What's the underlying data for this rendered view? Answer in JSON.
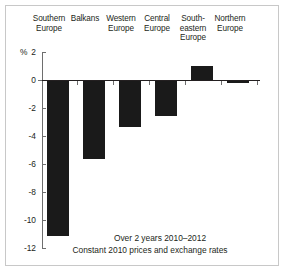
{
  "chart_data": {
    "type": "bar",
    "title": "",
    "subtitle": "",
    "xlabel": "",
    "ylabel": "%",
    "unit_label": "%",
    "categories": [
      "Southern Europe",
      "Balkans",
      "Western Europe",
      "Central Europe",
      "South-eastern Europe",
      "Northern Europe"
    ],
    "category_lines": [
      [
        "Southern",
        "Europe"
      ],
      [
        "Balkans"
      ],
      [
        "Western",
        "Europe"
      ],
      [
        "Central",
        "Europe"
      ],
      [
        "South-",
        "eastern",
        "Europe"
      ],
      [
        "Northern",
        "Europe"
      ]
    ],
    "values": [
      -11.1,
      -5.6,
      -3.3,
      -2.5,
      1.0,
      -0.1
    ],
    "ylim": [
      -12,
      2
    ],
    "yticks": [
      2,
      0,
      -2,
      -4,
      -6,
      -8,
      -10,
      -12
    ],
    "ytick_labels": [
      "2",
      "0",
      "-2",
      "-4",
      "-6",
      "-8",
      "-10",
      "-12"
    ],
    "grid": false,
    "legend": false,
    "bar_color": "#1a1a1a",
    "axis_color": "#6e6e6e",
    "annotations": [
      "Over 2 years 2010–2012",
      "Constant 2010 prices and exchange rates"
    ]
  },
  "caption": {
    "line1": "Over 2 years 2010–2012",
    "line2": "Constant 2010 prices and exchange rates"
  },
  "axis": {
    "unit": "%"
  }
}
